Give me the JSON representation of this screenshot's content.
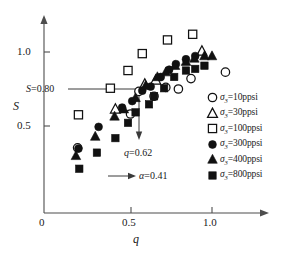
{
  "chart_data": {
    "type": "scatter",
    "title": "",
    "xlabel": "q",
    "ylabel": "S",
    "xlim": [
      0,
      1.22
    ],
    "ylim": [
      0,
      1.28
    ],
    "xticks": [
      0,
      0.5,
      1.0
    ],
    "xtick_labels": [
      "0",
      "0.5",
      "1.0"
    ],
    "yticks": [
      0.5,
      1.0
    ],
    "ytick_labels": [
      "0.5",
      "1.0"
    ],
    "grid": false,
    "legend_position": "right",
    "series": [
      {
        "name": "sigma3_10ppsi",
        "legend_label": "=10ppsi",
        "symbol": "σ",
        "subscript": "3",
        "marker": "circle-open",
        "points": [
          [
            0.2,
            0.405
          ],
          [
            0.515,
            0.615
          ],
          [
            0.565,
            0.755
          ],
          [
            0.655,
            0.725
          ],
          [
            0.725,
            0.78
          ],
          [
            0.8,
            0.77
          ],
          [
            0.875,
            0.835
          ],
          [
            1.08,
            0.875
          ]
        ]
      },
      {
        "name": "sigma3_30ppsi",
        "legend_label": "=30ppsi",
        "symbol": "σ",
        "subscript": "3",
        "marker": "triangle-open",
        "points": [
          [
            0.425,
            0.645
          ],
          [
            0.6,
            0.8
          ],
          [
            0.665,
            0.825
          ],
          [
            0.94,
            1.005
          ]
        ]
      },
      {
        "name": "sigma3_100ppsi",
        "legend_label": "=100ppsi",
        "symbol": "σ",
        "subscript": "3",
        "marker": "square-open",
        "points": [
          [
            0.205,
            0.61
          ],
          [
            0.395,
            0.775
          ],
          [
            0.5,
            0.885
          ],
          [
            0.585,
            0.99
          ],
          [
            0.735,
            1.075
          ],
          [
            0.885,
            1.11
          ]
        ]
      },
      {
        "name": "sigma3_300ppsi",
        "legend_label": "=300ppsi",
        "symbol": "σ",
        "subscript": "3",
        "marker": "circle-filled",
        "points": [
          [
            0.205,
            0.4
          ],
          [
            0.325,
            0.535
          ],
          [
            0.465,
            0.655
          ],
          [
            0.525,
            0.695
          ],
          [
            0.585,
            0.76
          ],
          [
            0.635,
            0.785
          ],
          [
            0.695,
            0.845
          ],
          [
            0.745,
            0.89
          ],
          [
            0.785,
            0.925
          ],
          [
            0.845,
            0.955
          ],
          [
            0.9,
            0.975
          ]
        ]
      },
      {
        "name": "sigma3_400ppsi",
        "legend_label": "=400ppsi",
        "symbol": "σ",
        "subscript": "3",
        "marker": "triangle-filled",
        "points": [
          [
            0.19,
            0.355
          ],
          [
            0.305,
            0.475
          ],
          [
            0.42,
            0.6
          ],
          [
            0.475,
            0.645
          ],
          [
            0.545,
            0.715
          ],
          [
            0.605,
            0.79
          ],
          [
            0.675,
            0.845
          ],
          [
            0.725,
            0.875
          ],
          [
            0.78,
            0.915
          ],
          [
            0.845,
            0.94
          ],
          [
            0.895,
            0.96
          ],
          [
            0.955,
            0.975
          ],
          [
            1.0,
            0.975
          ]
        ]
      },
      {
        "name": "sigma3_800ppsi",
        "legend_label": "=800ppsi",
        "symbol": "σ",
        "subscript": "3",
        "marker": "square-filled",
        "points": [
          [
            0.21,
            0.275
          ],
          [
            0.315,
            0.375
          ],
          [
            0.425,
            0.465
          ],
          [
            0.5,
            0.56
          ],
          [
            0.545,
            0.625
          ],
          [
            0.625,
            0.675
          ],
          [
            0.655,
            0.725
          ],
          [
            0.715,
            0.775
          ],
          [
            0.775,
            0.845
          ],
          [
            0.845,
            0.885
          ],
          [
            0.9,
            0.895
          ],
          [
            0.955,
            0.915
          ]
        ]
      }
    ],
    "annotations": [
      {
        "name": "s-threshold",
        "text": "=0.80",
        "symbol": "S",
        "kind": "horizontal-line-label",
        "value": 0.8
      },
      {
        "name": "q-threshold",
        "text": "=0.62",
        "symbol": "q",
        "kind": "vertical-arrow-label",
        "value": 0.62
      },
      {
        "name": "alpha-value",
        "text": "=0.41",
        "symbol": "α",
        "kind": "arrow-label",
        "value": 0.41
      }
    ]
  }
}
